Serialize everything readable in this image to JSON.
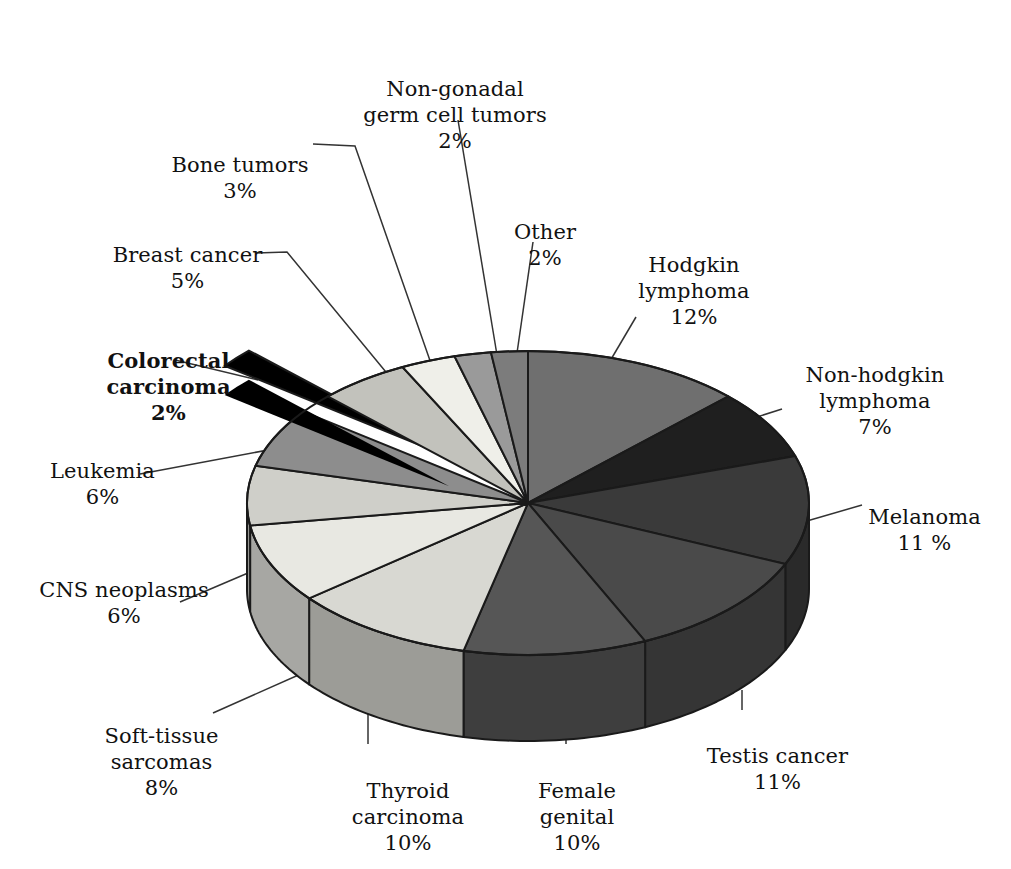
{
  "chart_data": {
    "type": "pie",
    "title": "",
    "subtitle": "",
    "xlabel": "",
    "ylabel": "",
    "legend_position": "callout-labels",
    "grid": false,
    "units": "%",
    "exploded_slice": "Colorectal carcinoma",
    "start_angle_deg": -90,
    "direction": "clockwise",
    "categories": [
      "Hodgkin lymphoma",
      "Non-hodgkin lymphoma",
      "Melanoma",
      "Testis cancer",
      "Female genital",
      "Thyroid carcinoma",
      "Soft-tissue sarcomas",
      "CNS neoplasms",
      "Leukemia",
      "Colorectal carcinoma",
      "Breast cancer",
      "Bone tumors",
      "Non-gonadal germ cell tumors",
      "Other"
    ],
    "values": [
      12,
      7,
      11,
      11,
      10,
      10,
      8,
      6,
      6,
      2,
      5,
      3,
      2,
      2
    ],
    "slice_colors": [
      "#6f6f6f",
      "#1f1f1f",
      "#3a3a3a",
      "#4a4a4a",
      "#565656",
      "#d8d8d2",
      "#e8e8e2",
      "#cfcfc9",
      "#8d8d8d",
      "#000000",
      "#c2c2bc",
      "#efefe9",
      "#9a9a9a",
      "#7c7c7c"
    ],
    "slices": [
      {
        "label": "Hodgkin lymphoma",
        "value": 12,
        "display": "12%"
      },
      {
        "label": "Non-hodgkin lymphoma",
        "value": 7,
        "display": "7%"
      },
      {
        "label": "Melanoma",
        "value": 11,
        "display": "11 %"
      },
      {
        "label": "Testis cancer",
        "value": 11,
        "display": "11%"
      },
      {
        "label": "Female genital",
        "value": 10,
        "display": "10%"
      },
      {
        "label": "Thyroid carcinoma",
        "value": 10,
        "display": "10%"
      },
      {
        "label": "Soft-tissue sarcomas",
        "value": 8,
        "display": "8%"
      },
      {
        "label": "CNS neoplasms",
        "value": 6,
        "display": "6%"
      },
      {
        "label": "Leukemia",
        "value": 6,
        "display": "6%"
      },
      {
        "label": "Colorectal carcinoma",
        "value": 2,
        "display": "2%"
      },
      {
        "label": "Breast cancer",
        "value": 5,
        "display": "5%"
      },
      {
        "label": "Bone tumors",
        "value": 3,
        "display": "3%"
      },
      {
        "label": "Non-gonadal germ cell tumors",
        "value": 2,
        "display": "2%"
      },
      {
        "label": "Other",
        "value": 2,
        "display": "2%"
      }
    ]
  },
  "labels": {
    "non_gonadal": {
      "name": "Non-gonadal\ngerm cell tumors",
      "pct": "2%"
    },
    "bone_tumors": {
      "name": "Bone tumors",
      "pct": "3%"
    },
    "breast_cancer": {
      "name": "Breast cancer",
      "pct": "5%"
    },
    "colorectal": {
      "name": "Colorectal carcinoma",
      "pct": "2%"
    },
    "leukemia": {
      "name": "Leukemia",
      "pct": "6%"
    },
    "cns": {
      "name": "CNS neoplasms",
      "pct": "6%"
    },
    "soft_tissue": {
      "name": "Soft-tissue\nsarcomas",
      "pct": "8%"
    },
    "thyroid": {
      "name": "Thyroid\ncarcinoma",
      "pct": "10%"
    },
    "female_genital": {
      "name": "Female\ngenital",
      "pct": "10%"
    },
    "testis": {
      "name": "Testis cancer",
      "pct": "11%"
    },
    "melanoma": {
      "name": "Melanoma",
      "pct": "11 %"
    },
    "non_hodgkin": {
      "name": "Non-hodgkin\nlymphoma",
      "pct": "7%"
    },
    "hodgkin": {
      "name": "Hodgkin\nlymphoma",
      "pct": "12%"
    },
    "other": {
      "name": "Other",
      "pct": "2%"
    }
  }
}
